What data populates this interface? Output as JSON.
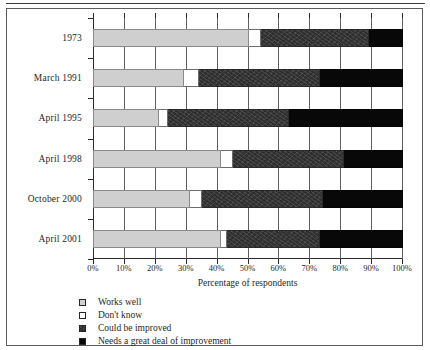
{
  "chart_data": {
    "type": "bar",
    "orientation": "horizontal",
    "stacked": true,
    "stack_total": 100,
    "title": "",
    "xlabel": "Percentage of respondents",
    "ylabel": "",
    "xlim": [
      0,
      100
    ],
    "grid": true,
    "legend_position": "below",
    "xticks": [
      0,
      10,
      20,
      30,
      40,
      50,
      60,
      70,
      80,
      90,
      100
    ],
    "xticklabels": [
      "0%",
      "10%",
      "20%",
      "30%",
      "40%",
      "50%",
      "60%",
      "70%",
      "80%",
      "90%",
      "100%"
    ],
    "categories": [
      "1973",
      "March 1991",
      "April 1995",
      "April 1998",
      "October 2000",
      "April 2001"
    ],
    "series": [
      {
        "name": "Works well",
        "color": "#cfcfcf",
        "values": [
          50,
          29,
          21,
          41,
          31,
          41
        ]
      },
      {
        "name": "Don't know",
        "color": "#ffffff",
        "values": [
          4,
          5,
          3,
          4,
          4,
          2
        ]
      },
      {
        "name": "Could be improved",
        "color": "#2e2e2e",
        "values": [
          35,
          39,
          39,
          36,
          39,
          30
        ]
      },
      {
        "name": "Needs a great deal of improvement",
        "color": "#080808",
        "values": [
          11,
          27,
          37,
          19,
          26,
          27
        ]
      }
    ],
    "cumulative_boundaries": {
      "1973": [
        50,
        54,
        89,
        100
      ],
      "March 1991": [
        29,
        34,
        73,
        100
      ],
      "April 1995": [
        21,
        24,
        63,
        100
      ],
      "April 1998": [
        41,
        45,
        81,
        100
      ],
      "October 2000": [
        31,
        35,
        74,
        100
      ],
      "April 2001": [
        41,
        43,
        73,
        100
      ]
    }
  },
  "legend": {
    "items": [
      {
        "label": "Works well"
      },
      {
        "label": "Don't know"
      },
      {
        "label": "Could be improved"
      },
      {
        "label": "Needs a great deal of improvement"
      }
    ]
  }
}
